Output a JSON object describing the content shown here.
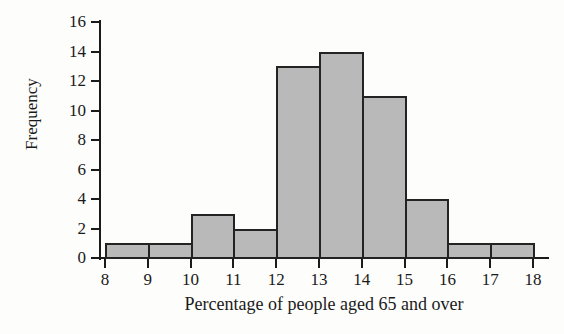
{
  "chart_data": {
    "type": "bar",
    "title": "",
    "subtitle": "",
    "xlabel": "Percentage of people aged 65 and over",
    "ylabel": "Frequency",
    "grid": false,
    "legend": null,
    "legend_position": "none",
    "bar_style": {
      "fill": "#b9b9b9",
      "edge": "#232323",
      "gap": 0
    },
    "xlim": [
      8,
      18
    ],
    "ylim": [
      0,
      16
    ],
    "xtick_labels": [
      "8",
      "9",
      "10",
      "11",
      "12",
      "13",
      "14",
      "15",
      "16",
      "17",
      "18"
    ],
    "xtick_values": [
      8,
      9,
      10,
      11,
      12,
      13,
      14,
      15,
      16,
      17,
      18
    ],
    "ytick_labels": [
      "0",
      "2",
      "4",
      "6",
      "8",
      "10",
      "12",
      "14",
      "16"
    ],
    "ytick_values": [
      0,
      2,
      4,
      6,
      8,
      10,
      12,
      14,
      16
    ],
    "bin_edges": [
      8,
      9,
      10,
      11,
      12,
      13,
      14,
      15,
      16,
      17,
      18
    ],
    "bin_labels": [
      "8-9",
      "9-10",
      "10-11",
      "11-12",
      "12-13",
      "13-14",
      "14-15",
      "15-16",
      "16-17",
      "17-18"
    ],
    "categories": [
      "8-9",
      "9-10",
      "10-11",
      "11-12",
      "12-13",
      "13-14",
      "14-15",
      "15-16",
      "16-17",
      "17-18"
    ],
    "values": [
      1,
      1,
      3,
      2,
      13,
      14,
      11,
      4,
      1,
      1
    ],
    "total_frequency": 51,
    "modal_class": "13-14",
    "annotations": []
  },
  "axis_titles": {
    "x": "Percentage of people aged 65 and over",
    "y": "Frequency"
  }
}
